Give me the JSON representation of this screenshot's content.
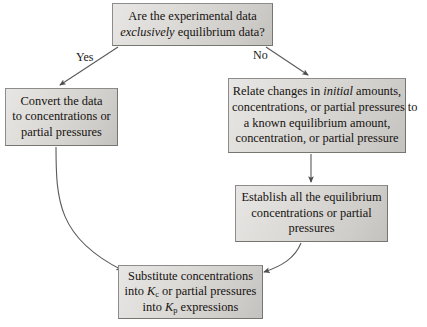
{
  "diagram": {
    "background_color": "#ffffff",
    "box_fill_color": "#dddbd8",
    "box_border_color": "#8d8c8a",
    "text_color": "#15120f",
    "connector_color": "#555555"
  },
  "nodes": {
    "question": {
      "name": "Are the experimental data exclusively equilibrium data?",
      "line1_a": "Are the experimental data",
      "line2_italic": "exclusively",
      "line2_b": " equilibrium data?"
    },
    "convert": {
      "line1": "Convert the data",
      "line2": "to concentrations or",
      "line3": "partial pressures"
    },
    "relate": {
      "line1_a": "Relate changes in ",
      "line1_italic": "initial",
      "line1_b": " amounts,",
      "line2": "concentrations, or partial pressures to",
      "line3": "a known equilibrium amount,",
      "line4": "concentration, or partial pressure"
    },
    "establish": {
      "line1": "Establish all the equilibrium",
      "line2": "concentrations or partial",
      "line3": "pressures"
    },
    "substitute": {
      "line1": "Substitute concentrations",
      "line2_a": "into ",
      "line2_k": "K",
      "line2_sub": "c",
      "line2_b": " or partial pressures",
      "line3_a": "into ",
      "line3_k": "K",
      "line3_sub": "p",
      "line3_b": " expressions"
    }
  },
  "branches": {
    "yes_label": "Yes",
    "no_label": "No"
  }
}
